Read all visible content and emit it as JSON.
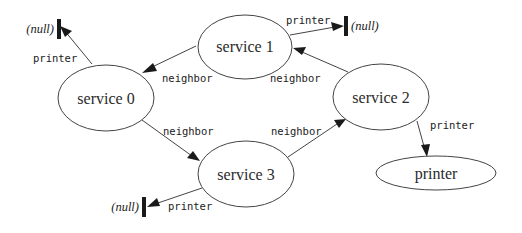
{
  "diagram": {
    "type": "service-graph",
    "nodes": [
      {
        "id": "s0",
        "label": "service 0"
      },
      {
        "id": "s1",
        "label": "service 1"
      },
      {
        "id": "s2",
        "label": "service 2"
      },
      {
        "id": "s3",
        "label": "service 3"
      },
      {
        "id": "printer",
        "label": "printer"
      }
    ],
    "null_terminals": [
      {
        "id": "null0",
        "label": "(null)"
      },
      {
        "id": "null1",
        "label": "(null)"
      },
      {
        "id": "null3",
        "label": "(null)"
      }
    ],
    "edges": [
      {
        "from": "s0",
        "to": "null0",
        "label": "printer"
      },
      {
        "from": "s1",
        "to": "s0",
        "label": "neighbor"
      },
      {
        "from": "s1",
        "to": "null1",
        "label": "printer"
      },
      {
        "from": "s2",
        "to": "s1",
        "label": "neighbor"
      },
      {
        "from": "s0",
        "to": "s3",
        "label": "neighbor"
      },
      {
        "from": "s3",
        "to": "s2",
        "label": "neighbor"
      },
      {
        "from": "s2",
        "to": "printer",
        "label": "printer"
      },
      {
        "from": "s3",
        "to": "null3",
        "label": "printer"
      }
    ]
  }
}
